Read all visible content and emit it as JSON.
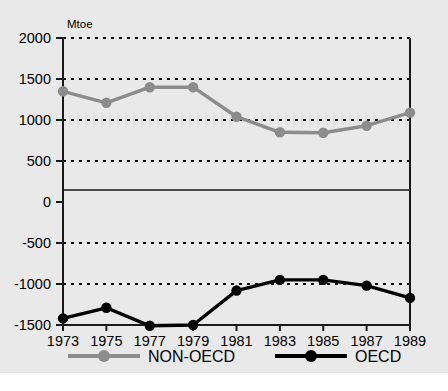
{
  "chart_data": {
    "type": "line",
    "title": "",
    "subtitle": "",
    "unit_label": "Mtoe",
    "xlabel": "",
    "ylabel": "Mtoe",
    "categories": [
      1973,
      1975,
      1977,
      1979,
      1981,
      1983,
      1985,
      1987,
      1989
    ],
    "xtick_labels": [
      "1973",
      "1975",
      "1977",
      "1979",
      "1981",
      "1983",
      "1985",
      "1987",
      "1989"
    ],
    "ytick_labels": [
      "2000",
      "1500",
      "1000",
      "500",
      "0",
      "-500",
      "-1000",
      "-1500"
    ],
    "yticks": [
      2000,
      1500,
      1000,
      500,
      0,
      -500,
      -1000,
      -1500
    ],
    "ylim": [
      -1500,
      2000
    ],
    "xlim": [
      1973,
      1989
    ],
    "grid": true,
    "grid_style": "dotted",
    "zero_line": true,
    "legend_position": "bottom",
    "series": [
      {
        "name": "NON-OECD",
        "color": "#8c8c8c",
        "marker": "circle",
        "values": [
          1350,
          1210,
          1400,
          1400,
          1040,
          850,
          845,
          930,
          1090
        ]
      },
      {
        "name": "OECD",
        "color": "#000000",
        "marker": "circle",
        "values": [
          -1420,
          -1290,
          -1510,
          -1500,
          -1080,
          -950,
          -950,
          -1020,
          -1170
        ]
      }
    ]
  },
  "colors": {
    "background": "#e9e9e9",
    "axis": "#1a1a1a",
    "grid": "#000000",
    "non_oecd": "#8c8c8c",
    "oecd": "#000000"
  },
  "legend": {
    "items": [
      {
        "label": "NON-OECD",
        "color": "#8c8c8c"
      },
      {
        "label": "OECD",
        "color": "#000000"
      }
    ]
  }
}
